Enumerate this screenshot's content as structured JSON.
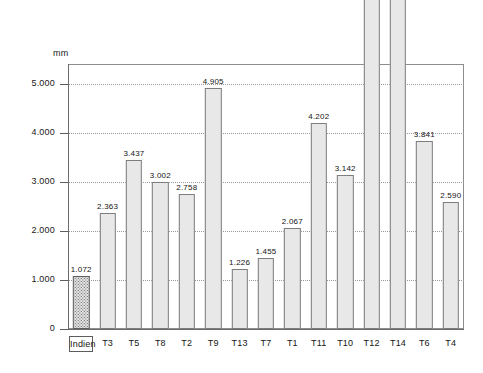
{
  "chart_data": {
    "type": "bar",
    "title": "",
    "subtitle": "",
    "xlabel": "",
    "ylabel": "mm",
    "unit_label": "mm",
    "grid": true,
    "legend": "none",
    "ylim": [
      0,
      12
    ],
    "yticks": [
      0,
      1000,
      2000,
      3000,
      4000,
      5000
    ],
    "ytick_labels": [
      "0",
      "1.000",
      "2.000",
      "3.000",
      "4.000",
      "5.000"
    ],
    "axis_top_value": 5400,
    "categories": [
      "Indien",
      "T3",
      "T5",
      "T8",
      "T2",
      "T9",
      "T13",
      "T7",
      "T1",
      "T11",
      "T10",
      "T12",
      "T14",
      "T6",
      "T4"
    ],
    "values": [
      1.072,
      2.363,
      3.437,
      3.002,
      2.758,
      4.905,
      1.226,
      1.455,
      2.067,
      4.202,
      3.142,
      10.869,
      11.407,
      3.841,
      2.59
    ],
    "value_labels": [
      "1.072",
      "2.363",
      "3.437",
      "3.002",
      "2.758",
      "4.905",
      "1.226",
      "1.455",
      "2.067",
      "4.202",
      "3.142",
      "10.869",
      "11.407",
      "3.841",
      "2.590"
    ],
    "highlight_index": 0,
    "highlight_style": "hatched",
    "colors": {
      "bar_fill": "#e8e8e8",
      "bar_border": "#7d7d7d",
      "highlight_fill": "#e2e2e2",
      "highlight_border": "#5f5f5f",
      "grid": "#9a9a9a",
      "axis": "#6b6b6b",
      "text": "#141414",
      "background": "#ffffff"
    }
  }
}
